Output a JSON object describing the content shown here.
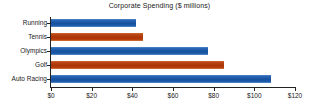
{
  "chart_data": {
    "type": "bar",
    "orientation": "horizontal",
    "title": "Corporate Spending ($ millions)",
    "xlabel": "",
    "ylabel": "",
    "categories": [
      "Running",
      "Tennis",
      "Olympics",
      "Golf",
      "Auto Racing"
    ],
    "values": [
      42,
      45,
      77,
      85,
      108
    ],
    "series": [
      {
        "name": "Corporate Spending",
        "values": [
          42,
          45,
          77,
          85,
          108
        ]
      }
    ],
    "bar_colors": [
      "#17529f",
      "#ab3509",
      "#17529f",
      "#ab3509",
      "#17529f"
    ],
    "xlim": [
      0,
      120
    ],
    "xticks": [
      0,
      20,
      40,
      60,
      80,
      100,
      120
    ],
    "xtick_labels": [
      "$0",
      "$20",
      "$40",
      "$60",
      "$80",
      "$100",
      "$120"
    ],
    "grid": false,
    "legend": null,
    "colors": {
      "blue": "#17529f",
      "red": "#ab3509",
      "axis": "#222222",
      "text": "#1a1a1a",
      "background": "#ffffff"
    }
  }
}
